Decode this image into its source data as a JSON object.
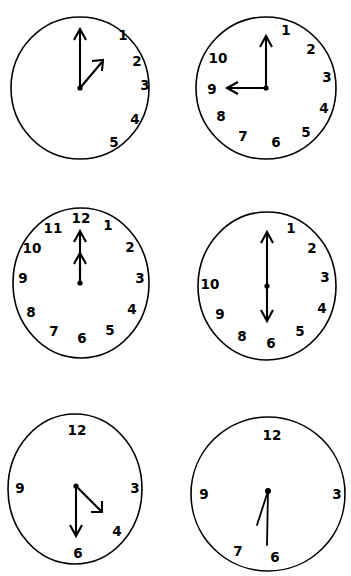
{
  "page": {
    "background_color": "#ffffff",
    "ink_color": "#000000",
    "columns": 2,
    "rows": 3
  },
  "clocks": [
    {
      "id": "clock-1",
      "position": "top-left",
      "numerals": [
        "1",
        "2",
        "3",
        "4",
        "5"
      ],
      "hour_hand_label": "hour-hand",
      "minute_hand_label": "minute-hand",
      "hour_hand_points_to": "1",
      "minute_hand_points_to": "12",
      "reads": "1:00"
    },
    {
      "id": "clock-2",
      "position": "top-right",
      "numerals": [
        "1",
        "2",
        "3",
        "4",
        "5",
        "6",
        "7",
        "8",
        "9",
        "10"
      ],
      "hour_hand_label": "hour-hand",
      "minute_hand_label": "minute-hand",
      "hour_hand_points_to": "9",
      "minute_hand_points_to": "12",
      "reads": "9:00"
    },
    {
      "id": "clock-3",
      "position": "middle-left",
      "numerals": [
        "1",
        "2",
        "3",
        "4",
        "5",
        "6",
        "7",
        "8",
        "9",
        "10",
        "11",
        "12"
      ],
      "hour_hand_label": "hour-hand",
      "minute_hand_label": "minute-hand",
      "hour_hand_points_to": "12",
      "minute_hand_points_to": "12",
      "reads": "12:00"
    },
    {
      "id": "clock-4",
      "position": "middle-right",
      "numerals": [
        "1",
        "2",
        "3",
        "4",
        "5",
        "6",
        "8",
        "9",
        "10"
      ],
      "hour_hand_label": "hour-hand",
      "minute_hand_label": "minute-hand",
      "hour_hand_points_to": "6",
      "minute_hand_points_to": "12",
      "reads": "6:00"
    },
    {
      "id": "clock-5",
      "position": "bottom-left",
      "numerals": [
        "12",
        "3",
        "4",
        "6",
        "9"
      ],
      "hour_hand_label": "hour-hand",
      "minute_hand_label": "minute-hand",
      "hour_hand_points_to": "4",
      "minute_hand_points_to": "6",
      "reads": "4:30"
    },
    {
      "id": "clock-6",
      "position": "bottom-right",
      "numerals": [
        "12",
        "3",
        "6",
        "7",
        "9"
      ],
      "hour_hand_label": "hour-hand",
      "minute_hand_label": "minute-hand",
      "hour_hand_points_to": "7",
      "minute_hand_points_to": "6",
      "reads": "6:30"
    }
  ]
}
